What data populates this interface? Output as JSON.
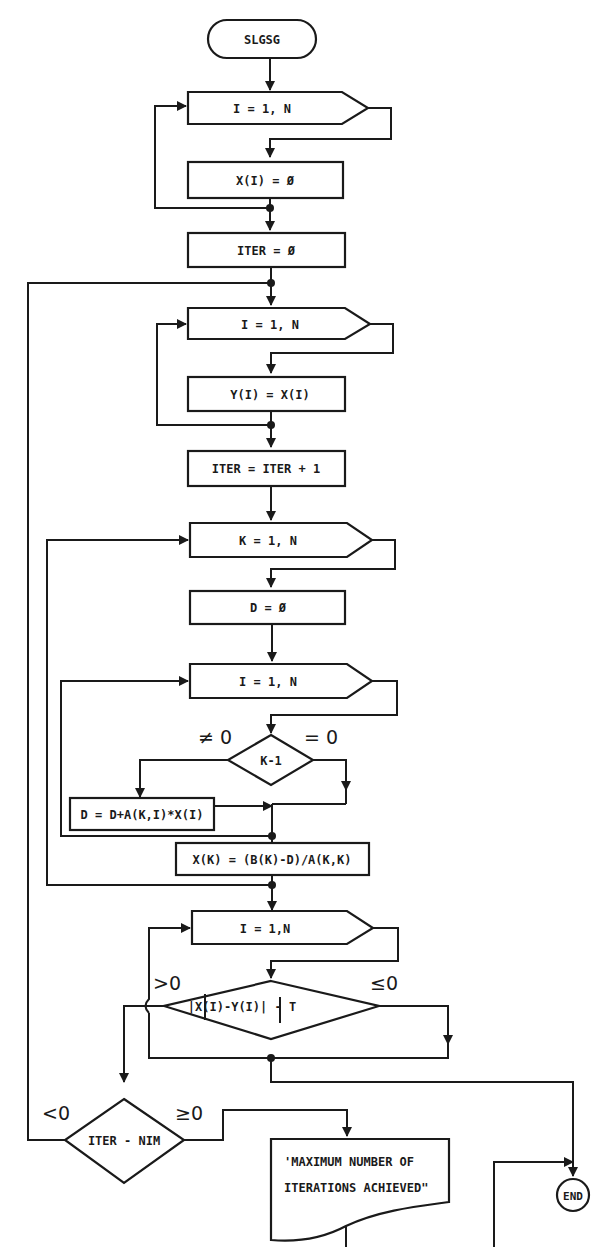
{
  "flowchart": {
    "start": "SLGSG",
    "loop1": "I = 1, N",
    "init_x": "X(I) = Ø",
    "init_iter": "ITER = Ø",
    "loop2": "I = 1, N",
    "copy_y": "Y(I) = X(I)",
    "inc_iter": "ITER = ITER + 1",
    "loop_k": "K = 1, N",
    "init_d": "D = Ø",
    "loop3": "I = 1, N",
    "decision_k": "K-1",
    "decision_k_ne": "≠ 0",
    "decision_k_eq": "= 0",
    "accumulate_d": "D = D+A(K,I)*X(I)",
    "compute_x": "X(K) = (B(K)-D)/A(K,K)",
    "loop4": "I = 1,N",
    "decision_conv": "|X(I)-Y(I)| - T",
    "decision_conv_gt": ">0",
    "decision_conv_le": "≤0",
    "decision_iter": "ITER - NIM",
    "decision_iter_lt": "<0",
    "decision_iter_ge": "≥0",
    "message_line1": "'MAXIMUM NUMBER OF",
    "message_line2": "ITERATIONS ACHIEVED\"",
    "end": "END"
  },
  "colors": {
    "ink": "#1a1a1a",
    "paper": "#ffffff"
  }
}
